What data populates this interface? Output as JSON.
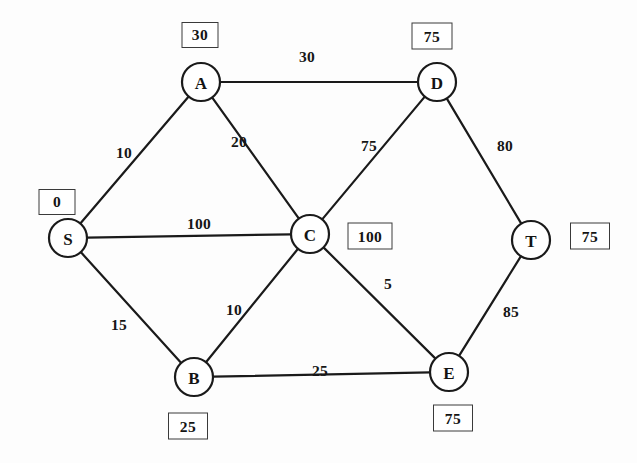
{
  "diagram": {
    "width": 637,
    "height": 463,
    "colors": {
      "background": "#fdfdfd",
      "stroke": "#1a1a1a",
      "text": "#141414",
      "box_border": "#3a3a3a"
    }
  },
  "nodes": [
    {
      "id": "A",
      "label": "A",
      "x": 201,
      "y": 82,
      "r": 19
    },
    {
      "id": "D",
      "label": "D",
      "x": 437,
      "y": 82,
      "r": 19
    },
    {
      "id": "S",
      "label": "S",
      "x": 68,
      "y": 238,
      "r": 19
    },
    {
      "id": "C",
      "label": "C",
      "x": 310,
      "y": 234,
      "r": 19
    },
    {
      "id": "T",
      "label": "T",
      "x": 531,
      "y": 240,
      "r": 19
    },
    {
      "id": "B",
      "label": "B",
      "x": 194,
      "y": 377,
      "r": 19
    },
    {
      "id": "E",
      "label": "E",
      "x": 449,
      "y": 372,
      "r": 19
    }
  ],
  "edges": [
    {
      "id": "S-A",
      "from": "S",
      "to": "A",
      "weight": "10",
      "label_x": 124,
      "label_y": 153
    },
    {
      "id": "A-D",
      "from": "A",
      "to": "D",
      "weight": "30",
      "label_x": 307,
      "label_y": 57
    },
    {
      "id": "A-C",
      "from": "A",
      "to": "C",
      "weight": "20",
      "label_x": 239,
      "label_y": 142
    },
    {
      "id": "C-D",
      "from": "C",
      "to": "D",
      "weight": "75",
      "label_x": 369,
      "label_y": 146
    },
    {
      "id": "D-T",
      "from": "D",
      "to": "T",
      "weight": "80",
      "label_x": 505,
      "label_y": 146
    },
    {
      "id": "S-C",
      "from": "S",
      "to": "C",
      "weight": "100",
      "label_x": 199,
      "label_y": 224
    },
    {
      "id": "C-E",
      "from": "C",
      "to": "E",
      "weight": "5",
      "label_x": 388,
      "label_y": 284
    },
    {
      "id": "T-E",
      "from": "T",
      "to": "E",
      "weight": "85",
      "label_x": 511,
      "label_y": 312
    },
    {
      "id": "S-B",
      "from": "S",
      "to": "B",
      "weight": "15",
      "label_x": 119,
      "label_y": 325
    },
    {
      "id": "B-C",
      "from": "B",
      "to": "C",
      "weight": "10",
      "label_x": 234,
      "label_y": 310
    },
    {
      "id": "B-E",
      "from": "B",
      "to": "E",
      "weight": "25",
      "label_x": 320,
      "label_y": 371
    }
  ],
  "distance_boxes": [
    {
      "node": "A",
      "value": "30",
      "x": 200,
      "y": 35,
      "w": 37,
      "h": 26
    },
    {
      "node": "D",
      "value": "75",
      "x": 432,
      "y": 36,
      "w": 41,
      "h": 27
    },
    {
      "node": "S",
      "value": "0",
      "x": 57,
      "y": 202,
      "w": 37,
      "h": 26
    },
    {
      "node": "C",
      "value": "100",
      "x": 370,
      "y": 236,
      "w": 45,
      "h": 27
    },
    {
      "node": "T",
      "value": "75",
      "x": 590,
      "y": 236,
      "w": 40,
      "h": 27
    },
    {
      "node": "B",
      "value": "25",
      "x": 188,
      "y": 426,
      "w": 40,
      "h": 27
    },
    {
      "node": "E",
      "value": "75",
      "x": 453,
      "y": 418,
      "w": 40,
      "h": 27
    }
  ]
}
